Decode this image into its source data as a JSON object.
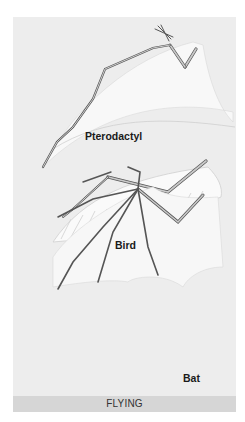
{
  "figure": {
    "title": "FLYING",
    "panels": [
      {
        "id": "pterodactyl",
        "label": "Pterodactyl"
      },
      {
        "id": "bird",
        "label": "Bird"
      },
      {
        "id": "bat",
        "label": "Bat"
      }
    ]
  },
  "colors": {
    "background": "#ededed",
    "membrane": "#f7f7f7",
    "bone": "#bdbdbd",
    "bone_outline": "#555555",
    "footer_band": "#d6d6d6"
  }
}
